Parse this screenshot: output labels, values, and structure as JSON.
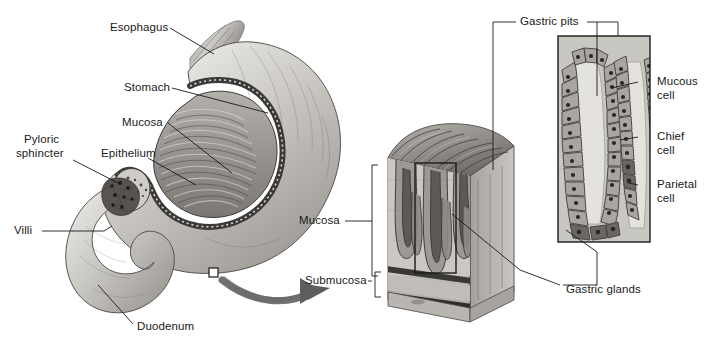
{
  "figure": {
    "background": "#ffffff",
    "ink": "#1a1a1a",
    "width": 715,
    "height": 351
  },
  "labels": {
    "esophagus": "Esophagus",
    "stomach": "Stomach",
    "mucosa_upper": "Mucosa",
    "epithelium": "Epithelium",
    "pyloric_line1": "Pyloric",
    "pyloric_line2": "sphincter",
    "villi": "Villi",
    "duodenum": "Duodenum",
    "mucosa_block": "Mucosa",
    "submucosa_block": "Submucosa",
    "gastric_pits": "Gastric pits",
    "gastric_glands": "Gastric glands",
    "mucous_line1": "Mucous",
    "mucous_line2": "cell",
    "chief_line1": "Chief",
    "chief_line2": "cell",
    "parietal_line1": "Parietal",
    "parietal_line2": "cell"
  },
  "panels": {
    "left": {
      "name": "Sagittal section of stomach and duodenum",
      "parts": [
        "Esophagus",
        "Stomach",
        "Mucosa",
        "Epithelium",
        "Pyloric sphincter",
        "Villi",
        "Duodenum"
      ]
    },
    "middle": {
      "name": "Three-dimensional block of gastric wall",
      "brackets": [
        "Mucosa",
        "Submucosa"
      ],
      "callouts": [
        "Gastric pits",
        "Gastric glands"
      ]
    },
    "right": {
      "name": "Gastric pit and gland cell detail",
      "cells": [
        "Mucous cell",
        "Chief cell",
        "Parietal cell"
      ]
    }
  },
  "markers": {
    "magnify_square": "magnification-source-square",
    "magnify_arrow": "magnification-arrow"
  },
  "palette": {
    "line": "#1a1a1a",
    "tissue_light": "#d9d6d0",
    "tissue_mid": "#a9a6a0",
    "tissue_dark": "#6f6c68",
    "tissue_darkest": "#3c3a38",
    "lumen": "#e8e6e1",
    "serosa": "#c4c1bb",
    "arrow_gray": "#6b6b6b"
  }
}
